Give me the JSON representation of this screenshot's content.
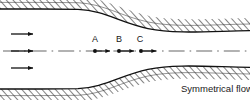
{
  "figure": {
    "title_caption": "Symmetrical flow",
    "background_color": "#ffffff",
    "line_color": "#111111",
    "hatch_color": "#2a2a2a",
    "width": 250,
    "height": 100
  },
  "station_labels": [
    {
      "id": "A",
      "text": "A",
      "x": 95,
      "y": 42
    },
    {
      "id": "B",
      "text": "B",
      "x": 119,
      "y": 42
    },
    {
      "id": "C",
      "text": "C",
      "x": 140,
      "y": 42
    }
  ],
  "station_points": [
    {
      "id": "A",
      "cx": 95,
      "cy": 51
    },
    {
      "id": "B",
      "cx": 119,
      "cy": 51
    },
    {
      "id": "C",
      "cx": 141,
      "cy": 51
    }
  ],
  "station_arrows": [
    {
      "id": "A",
      "x1": 96,
      "x2": 111,
      "y": 51
    },
    {
      "id": "B",
      "x1": 120,
      "x2": 135,
      "y": 51
    },
    {
      "id": "C",
      "x1": 142,
      "x2": 157,
      "y": 51
    }
  ],
  "inlet_arrows": [
    {
      "id": "upper",
      "x1": 11,
      "x2": 35,
      "y": 34
    },
    {
      "id": "middle",
      "x1": 11,
      "x2": 35,
      "y": 51
    },
    {
      "id": "lower",
      "x1": 11,
      "x2": 35,
      "y": 68
    }
  ],
  "centerline": {
    "y": 51,
    "x_start": 3,
    "x_end": 247,
    "style": "dash-dot"
  },
  "upper_wall": {
    "description": "converging upper channel wall with hatching above",
    "inlet_y": 9,
    "outlet_y": 31,
    "path": "M 40,9 L 78,9.3 C 104,10.5 120,22.5 148,28.6 C 176,34.4 210,31.2 250,30.6"
  },
  "lower_wall": {
    "description": "diverging lower channel wall with hatching below",
    "inlet_y": 89,
    "outlet_y": 69,
    "path": "M 40,89 L 78,88.7 C 104,87.5 120,75.5 148,69.4 C 176,63.6 210,66.8 250,67.4"
  },
  "caption": {
    "text": "Symmetrical flow",
    "x": 181,
    "y": 92
  }
}
